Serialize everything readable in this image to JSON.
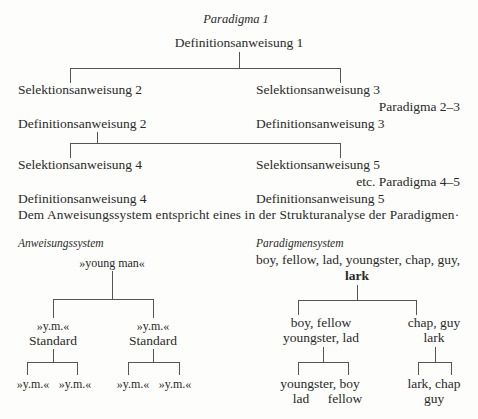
{
  "paradigm1": {
    "title": "Paradigma 1",
    "root": "Definitionsanweisung 1",
    "left": "Selektionsanweisung 2",
    "right": "Selektionsanweisung 3",
    "paradigm_label": "Paradigma 2–3"
  },
  "paradigm2": {
    "def_left": "Definitionsanweisung 2",
    "def_right": "Definitionsanweisung 3",
    "sel_left": "Selektionsanweisung 4",
    "sel_right": "Selektionsanweisung 5",
    "paradigm_label": "etc. Paradigma 4–5",
    "def4": "Definitionsanweisung 4",
    "def5": "Definitionsanweisung 5"
  },
  "sentence": "Dem Anweisungssystem entspricht eines in der Strukturanalyse der Paradigmen·",
  "anweisungssystem": {
    "heading": "Anweisungssystem",
    "root": "»young man«",
    "left": {
      "label": "»y.m.«",
      "sub": "Standard",
      "children": [
        "»y.m.«",
        "»y.m.«"
      ]
    },
    "right": {
      "label": "»y.m.«",
      "sub": "Standard",
      "children": [
        "»y.m.«",
        "»y.m.«"
      ]
    }
  },
  "paradigmensystem": {
    "heading": "Paradigmensystem",
    "root_line1": "boy, fellow, lad, youngster, chap, guy,",
    "root_line2": "lark",
    "left": {
      "line1": "boy, fellow",
      "line2": "youngster, lad",
      "children_line1": "youngster, boy",
      "children_line2_left": "lad",
      "children_line2_right": "fellow"
    },
    "right": {
      "line1": "chap, guy",
      "line2": "lark",
      "children_line1": "lark, chap",
      "children_line2": "guy"
    }
  }
}
